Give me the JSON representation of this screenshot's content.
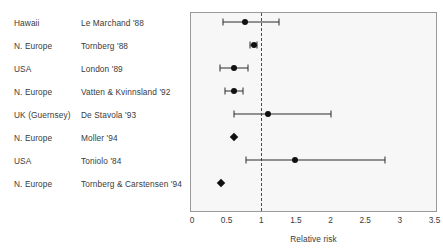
{
  "chart_data": {
    "type": "scatter",
    "subtype": "forest-plot",
    "title": "",
    "xlabel": "Relative risk",
    "ylabel": "",
    "xlim": [
      0,
      3.5
    ],
    "xticks": [
      "0",
      "0.5",
      "1",
      "1.5",
      "2",
      "2.5",
      "3",
      "3.5"
    ],
    "xtick_values": [
      0,
      0.5,
      1,
      1.5,
      2,
      2.5,
      3,
      3.5
    ],
    "grid": false,
    "reference_line": 1,
    "legend": "none",
    "columns": [
      "Region",
      "Study",
      "Relative risk"
    ],
    "rows": [
      {
        "region": "Hawaii",
        "study": "Le Marchand '88",
        "estimate": 0.77,
        "ci_low": 0.45,
        "ci_high": 1.26,
        "marker": "circle",
        "has_interval": true
      },
      {
        "region": "N. Europe",
        "study": "Tornberg '88",
        "estimate": 0.89,
        "ci_low": 0.84,
        "ci_high": 0.94,
        "marker": "circle",
        "has_interval": true
      },
      {
        "region": "USA",
        "study": "London '89",
        "estimate": 0.61,
        "ci_low": 0.41,
        "ci_high": 0.81,
        "marker": "circle",
        "has_interval": true
      },
      {
        "region": "N. Europe",
        "study": "Vatten & Kvinnsland '92",
        "estimate": 0.6,
        "ci_low": 0.48,
        "ci_high": 0.74,
        "marker": "circle",
        "has_interval": true
      },
      {
        "region": "UK (Guernsey)",
        "study": "De Stavola '93",
        "estimate": 1.09,
        "ci_low": 0.6,
        "ci_high": 2.0,
        "marker": "circle",
        "has_interval": true
      },
      {
        "region": "N. Europe",
        "study": "Moller '94",
        "estimate": 0.6,
        "ci_low": null,
        "ci_high": null,
        "marker": "diamond",
        "has_interval": false
      },
      {
        "region": "USA",
        "study": "Toniolo '84",
        "estimate": 1.48,
        "ci_low": 0.78,
        "ci_high": 2.79,
        "marker": "circle",
        "has_interval": true
      },
      {
        "region": "N. Europe",
        "study": "Tornberg & Carstensen '94",
        "estimate": 0.42,
        "ci_low": null,
        "ci_high": null,
        "marker": "diamond",
        "has_interval": false
      }
    ]
  },
  "colors": {
    "panel_background": "#f7f7f7",
    "panel_border": "#9a9a9a",
    "marker": "#111111",
    "interval": "#2b2b2b",
    "reference_line": "#4a4a4a",
    "text": "#3a3a3a"
  }
}
